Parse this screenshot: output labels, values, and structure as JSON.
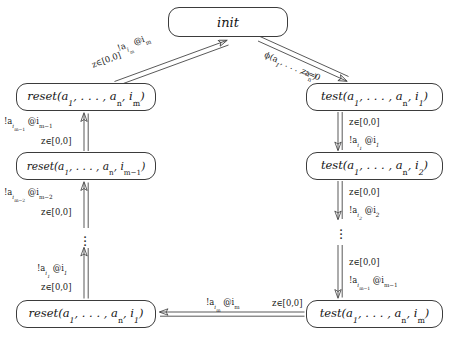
{
  "diagram": {
    "type": "state-transition-diagram",
    "line_color": "#3b3b3b",
    "text_color": "#141414",
    "background": "#ffffff"
  },
  "nodes": {
    "init": {
      "id": "init",
      "label_html": "init",
      "x": 168,
      "y": 7,
      "w": 120,
      "h": 30
    },
    "reset_im": {
      "id": "reset-im",
      "label_html": "reset(a<sub>1</sub>, . . . , a<sub><span class=\"up\">n</span></sub>, i<sub><span class=\"up\">m</span></sub>)",
      "x": 16,
      "y": 83,
      "w": 140,
      "h": 28
    },
    "reset_im1": {
      "id": "reset-im-1",
      "label_html": "reset(a<sub>1</sub>, . . . , a<sub><span class=\"up\">n</span></sub>, i<sub><span class=\"up\">m&#8722;1</span></sub>)",
      "x": 16,
      "y": 152,
      "w": 140,
      "h": 28
    },
    "reset_i1": {
      "id": "reset-i1",
      "label_html": "reset(a<sub>1</sub>, . . . , a<sub><span class=\"up\">n</span></sub>, i<sub>1</sub>)",
      "x": 16,
      "y": 300,
      "w": 140,
      "h": 28
    },
    "test_i1": {
      "id": "test-i1",
      "label_html": "test(a<sub>1</sub>, . . . , a<sub><span class=\"up\">n</span></sub>, i<sub>1</sub>)",
      "x": 306,
      "y": 83,
      "w": 137,
      "h": 28
    },
    "test_i2": {
      "id": "test-i2",
      "label_html": "test(a<sub>1</sub>, . . . , a<sub><span class=\"up\">n</span></sub>, i<sub>2</sub>)",
      "x": 306,
      "y": 152,
      "w": 137,
      "h": 28
    },
    "test_im": {
      "id": "test-im",
      "label_html": "test(a<sub>1</sub>, . . . , a<sub><span class=\"up\">n</span></sub>, i<sub><span class=\"up\">m</span></sub>)",
      "x": 306,
      "y": 300,
      "w": 137,
      "h": 28
    }
  },
  "edges": [
    {
      "id": "reset-im-to-init",
      "from": "reset_im",
      "to": "init",
      "action_html": "!a<sub>i<sub><span class=\"up\">m</span></sub></sub> @i<sub><span class=\"up\">m</span></sub>",
      "guard_html": "z&#8712;[0,0]"
    },
    {
      "id": "init-to-test-i1",
      "from": "init",
      "to": "test_i1",
      "action_html": "&#981;(a<sub>1</sub>, . . . , a<sub><span class=\"up\">n</span></sub>)",
      "guard_html": "z:=0"
    },
    {
      "id": "reset-im1-to-reset-im",
      "from": "reset_im1",
      "to": "reset_im",
      "action_html": "!a<sub>i<sub><span class=\"up\">m&#8722;1</span></sub></sub> @i<sub><span class=\"up\">m&#8722;1</span></sub>",
      "guard_html": "z&#8712;[0,0]"
    },
    {
      "id": "reset-chain-mid",
      "from": "reset_dots",
      "to": "reset_im1",
      "action_html": "!a<sub>i<sub><span class=\"up\">m&#8722;2</span></sub></sub> @i<sub><span class=\"up\">m&#8722;2</span></sub>",
      "guard_html": "z&#8712;[0,0]"
    },
    {
      "id": "reset-i1-to-chain",
      "from": "reset_i1",
      "to": "reset_dots",
      "action_html": "!a<sub>i<sub>1</sub></sub> @i<sub>1</sub>",
      "guard_html": "z&#8712;[0,0]"
    },
    {
      "id": "test-i1-to-test-i2",
      "from": "test_i1",
      "to": "test_i2",
      "guard_html": "z&#8712;[0,0]",
      "action_html": "!a<sub>i<sub>1</sub></sub> @i<sub>1</sub>"
    },
    {
      "id": "test-i2-to-chain",
      "from": "test_i2",
      "to": "test_dots",
      "guard_html": "z&#8712;[0,0]",
      "action_html": "!a<sub>i<sub>2</sub></sub> @i<sub>2</sub>"
    },
    {
      "id": "test-chain-to-test-im",
      "from": "test_dots",
      "to": "test_im",
      "guard_html": "z&#8712;[0,0]",
      "action_html": "!a<sub>i<sub><span class=\"up\">m&#8722;1</span></sub></sub> @i<sub><span class=\"up\">m&#8722;1</span></sub>"
    },
    {
      "id": "test-im-to-reset-i1",
      "from": "test_im",
      "to": "reset_i1",
      "action_html": "!a<sub>i<sub><span class=\"up\">m</span></sub></sub> @i<sub><span class=\"up\">m</span></sub>",
      "guard_html": "z&#8712;[0,0]"
    }
  ],
  "ellipses": [
    {
      "id": "reset-column-ellipsis",
      "x": 75,
      "y": 232
    },
    {
      "id": "test-column-ellipsis",
      "x": 348,
      "y": 228
    }
  ]
}
